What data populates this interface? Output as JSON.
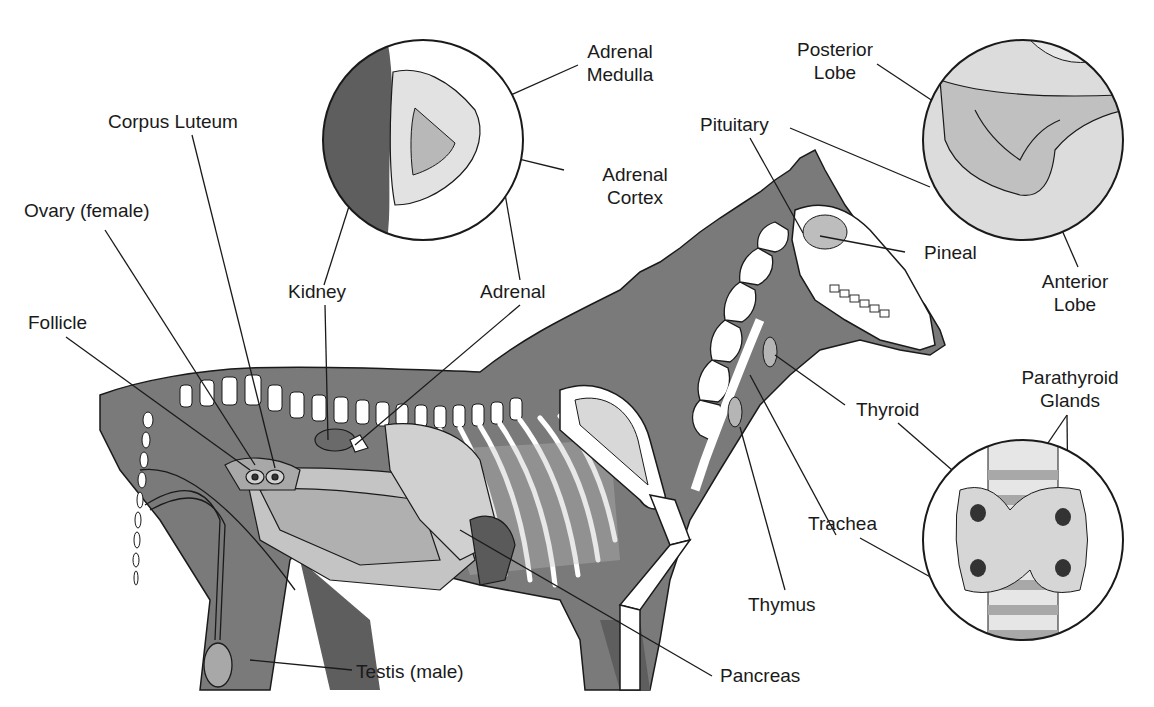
{
  "diagram": {
    "colors": {
      "body": "#7a7a7a",
      "body_dark": "#5e5e5e",
      "organ_light": "#c4c4c4",
      "organ_mid": "#a8a8a8",
      "bone": "#ffffff",
      "outline": "#1a1a1a",
      "background": "#ffffff"
    },
    "insets": [
      {
        "name": "adrenal-inset",
        "depicts": "Adrenal gland cross-section on kidney"
      },
      {
        "name": "pituitary-inset",
        "depicts": "Pituitary gland lobes"
      },
      {
        "name": "thyroid-inset",
        "depicts": "Thyroid with parathyroid glands on trachea"
      }
    ],
    "labels": {
      "adrenal_medulla_1": "Adrenal",
      "adrenal_medulla_2": "Medulla",
      "corpus_luteum": "Corpus Luteum",
      "adrenal_cortex_1": "Adrenal",
      "adrenal_cortex_2": "Cortex",
      "ovary": "Ovary (female)",
      "kidney": "Kidney",
      "adrenal": "Adrenal",
      "follicle": "Follicle",
      "posterior_lobe_1": "Posterior",
      "posterior_lobe_2": "Lobe",
      "pituitary": "Pituitary",
      "pineal": "Pineal",
      "anterior_lobe_1": "Anterior",
      "anterior_lobe_2": "Lobe",
      "parathyroid_1": "Parathyroid",
      "parathyroid_2": "Glands",
      "thyroid": "Thyroid",
      "trachea": "Trachea",
      "thymus": "Thymus",
      "testis": "Testis (male)",
      "pancreas": "Pancreas"
    }
  }
}
